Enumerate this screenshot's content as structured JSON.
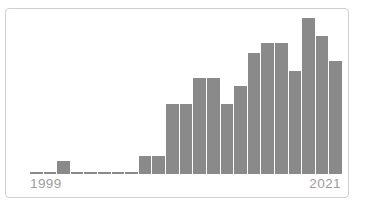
{
  "chart": {
    "x_tick_left": "1999",
    "x_tick_right": "2021",
    "colors": {
      "bar": "#8a8a8a",
      "frame_border": "#cfcfcf",
      "tick_label": "#9d9d9d",
      "background": "#ffffff"
    }
  },
  "chart_data": {
    "type": "bar",
    "title": "",
    "xlabel": "",
    "ylabel": "",
    "categories": [
      "1999",
      "2000",
      "2001",
      "2002",
      "2003",
      "2004",
      "2005",
      "2006",
      "2007",
      "2008",
      "2009",
      "2010",
      "2011",
      "2012",
      "2013",
      "2014",
      "2015",
      "2016",
      "2017",
      "2018",
      "2019",
      "2020",
      "2021"
    ],
    "values": [
      1,
      1,
      5,
      1,
      1,
      1,
      1,
      1,
      7,
      7,
      28,
      28,
      38,
      38,
      28,
      35,
      48,
      52,
      52,
      41,
      62,
      55,
      45
    ],
    "ylim": [
      0,
      62
    ],
    "grid": false,
    "legend": false,
    "visible_x_tick_labels": [
      "1999",
      "2021"
    ],
    "bar_color": "#8a8a8a",
    "notes_scale": "y-axis unlabeled; values estimated relative to smallest bar = 1"
  }
}
